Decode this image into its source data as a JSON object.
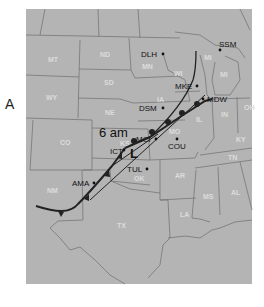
{
  "panel_label": "A",
  "map": {
    "background_color": "#ffffff",
    "land_color": "#b4b4b4",
    "border_color": "#6e6e6e",
    "front_color": "#222222",
    "time_label": "6 am",
    "low_symbol": "L",
    "states": [
      {
        "abbr": "MT",
        "x": 48,
        "y": 62
      },
      {
        "abbr": "WY",
        "x": 48,
        "y": 100
      },
      {
        "abbr": "CO",
        "x": 63,
        "y": 145
      },
      {
        "abbr": "NM",
        "x": 53,
        "y": 193
      },
      {
        "abbr": "ND",
        "x": 103,
        "y": 57
      },
      {
        "abbr": "SD",
        "x": 107,
        "y": 85
      },
      {
        "abbr": "NE",
        "x": 111,
        "y": 115
      },
      {
        "abbr": "KS",
        "x": 125,
        "y": 146
      },
      {
        "abbr": "OK",
        "x": 137,
        "y": 180
      },
      {
        "abbr": "TX",
        "x": 120,
        "y": 227
      },
      {
        "abbr": "MN",
        "x": 145,
        "y": 68
      },
      {
        "abbr": "IA",
        "x": 155,
        "y": 100
      },
      {
        "abbr": "WI",
        "x": 176,
        "y": 73
      },
      {
        "abbr": "MI",
        "x": 200,
        "y": 58
      },
      {
        "abbr": "MI",
        "x": 222,
        "y": 74
      },
      {
        "abbr": "IL",
        "x": 197,
        "y": 119
      },
      {
        "abbr": "IN",
        "x": 223,
        "y": 115
      },
      {
        "abbr": "OH",
        "x": 246,
        "y": 108
      },
      {
        "abbr": "MO",
        "x": 170,
        "y": 132
      },
      {
        "abbr": "KY",
        "x": 237,
        "y": 140
      },
      {
        "abbr": "TN",
        "x": 230,
        "y": 159
      },
      {
        "abbr": "AR",
        "x": 178,
        "y": 177
      },
      {
        "abbr": "MS",
        "x": 207,
        "y": 197
      },
      {
        "abbr": "AL",
        "x": 235,
        "y": 193
      },
      {
        "abbr": "LA",
        "x": 184,
        "y": 216
      }
    ],
    "cities": [
      {
        "name": "DLH",
        "dot_x": 163,
        "dot_y": 54,
        "label_x": 141,
        "label_y": 57
      },
      {
        "name": "SSM",
        "dot_x": 220,
        "dot_y": 50,
        "label_x": 219,
        "label_y": 47
      },
      {
        "name": "MKE",
        "dot_x": 197,
        "dot_y": 86,
        "label_x": 175,
        "label_y": 89
      },
      {
        "name": "MDW",
        "dot_x": 203,
        "dot_y": 99,
        "label_x": 208,
        "label_y": 102
      },
      {
        "name": "DSM",
        "dot_x": 163,
        "dot_y": 108,
        "label_x": 139,
        "label_y": 111
      },
      {
        "name": "MCI",
        "dot_x": 156,
        "dot_y": 139,
        "label_x": 136,
        "label_y": 142
      },
      {
        "name": "COU",
        "dot_x": 177,
        "dot_y": 139,
        "label_x": 168,
        "label_y": 148
      },
      {
        "name": "ICT",
        "dot_x": 124,
        "dot_y": 148,
        "label_x": 110,
        "label_y": 153
      },
      {
        "name": "TUL",
        "dot_x": 147,
        "dot_y": 169,
        "label_x": 127,
        "label_y": 172
      },
      {
        "name": "AMA",
        "dot_x": 94,
        "dot_y": 182,
        "label_x": 72,
        "label_y": 186
      }
    ]
  }
}
